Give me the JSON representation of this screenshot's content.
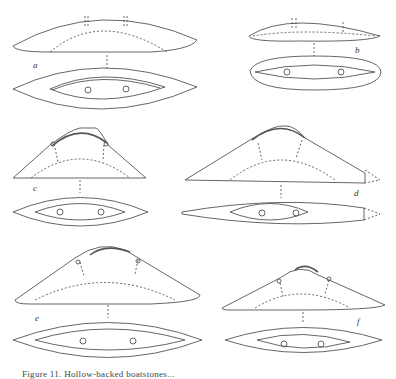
{
  "figure": {
    "panels": [
      {
        "label": "a",
        "description": "hollow-backed boatstone, side and bottom views"
      },
      {
        "label": "b",
        "description": "short boatstone with rounded ends, side and bottom views"
      },
      {
        "label": "c",
        "description": "keeled boatstone with raised ridge, side and bottom views"
      },
      {
        "label": "d",
        "description": "long keeled boatstone with broken tip, side and bottom views"
      },
      {
        "label": "e",
        "description": "wide keeled boatstone with ridge, side and bottom views"
      },
      {
        "label": "f",
        "description": "smaller keeled boatstone with ridge, side and bottom views"
      }
    ],
    "caption": "Figure 11. Hollow-backed boatstones..."
  },
  "colors": {
    "line": "#555555",
    "background": "#ffffff"
  }
}
